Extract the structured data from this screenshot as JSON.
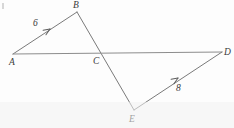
{
  "figure": {
    "type": "geometry-diagram",
    "width": 234,
    "height": 128,
    "background_color": "#fdfdfd",
    "stroke_color": "#7a7a7a",
    "text_color": "#3a3a3a",
    "stroke_width": 1
  },
  "points": {
    "A": {
      "label": "A",
      "x": 13,
      "y": 54,
      "label_x": 9,
      "label_y": 58
    },
    "B": {
      "label": "B",
      "x": 77,
      "y": 12,
      "label_x": 73,
      "label_y": 1
    },
    "C": {
      "label": "C",
      "x": 102,
      "y": 53,
      "label_x": 93,
      "label_y": 57
    },
    "D": {
      "label": "D",
      "x": 222,
      "y": 52,
      "label_x": 224,
      "label_y": 48
    },
    "E": {
      "label": "E",
      "x": 134,
      "y": 110,
      "label_x": 129,
      "label_y": 115
    }
  },
  "segments": [
    {
      "name": "segment-ab",
      "from": "A",
      "to": "B",
      "x1": 13,
      "y1": 54,
      "x2": 77,
      "y2": 12
    },
    {
      "name": "segment-be",
      "from": "B",
      "to": "E",
      "x1": 77,
      "y1": 12,
      "x2": 134,
      "y2": 110
    },
    {
      "name": "segment-ad",
      "from": "A",
      "to": "D",
      "x1": 13,
      "y1": 54,
      "x2": 222,
      "y2": 52
    },
    {
      "name": "segment-ed",
      "from": "E",
      "to": "D",
      "x1": 134,
      "y1": 110,
      "x2": 222,
      "y2": 52
    }
  ],
  "arrow_markers": [
    {
      "name": "arrow-on-ab",
      "on_segment": "segment-ab",
      "tip_x": 50,
      "tip_y": 29,
      "angle_deg": -33,
      "measure": "6"
    },
    {
      "name": "arrow-on-ed",
      "on_segment": "segment-ed",
      "tip_x": 178,
      "tip_y": 78,
      "angle_deg": -33,
      "measure": "8"
    }
  ],
  "measures": {
    "ab": {
      "value": "6",
      "x": 33,
      "y": 19
    },
    "ed": {
      "value": "8",
      "x": 176,
      "y": 84
    }
  }
}
